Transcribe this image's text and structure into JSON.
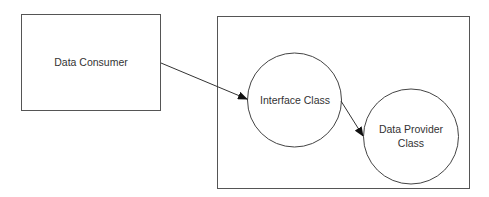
{
  "diagram": {
    "consumer": {
      "label": "Data Consumer"
    },
    "container": {
      "label": ""
    },
    "interface": {
      "label": "Interface Class"
    },
    "provider": {
      "line1": "Data Provider",
      "line2": "Class"
    },
    "edges": [
      {
        "from": "Data Consumer",
        "to": "Interface Class"
      },
      {
        "from": "Interface Class",
        "to": "Data Provider Class"
      }
    ]
  }
}
